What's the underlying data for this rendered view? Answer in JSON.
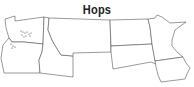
{
  "map": {
    "title": "Hops",
    "region": "Northwestern and North-Central United States",
    "states": [
      "Washington",
      "Oregon",
      "Idaho",
      "Montana",
      "North Dakota",
      "South Dakota",
      "Minnesota",
      "Iowa"
    ],
    "markers": {
      "description": "Dots indicating hop-growing areas",
      "locations": [
        "Yakima Valley, Washington",
        "Willamette Valley, Oregon"
      ]
    },
    "colors": {
      "fill": "#ffffff",
      "border": "#555555",
      "marker": "#444444"
    }
  }
}
